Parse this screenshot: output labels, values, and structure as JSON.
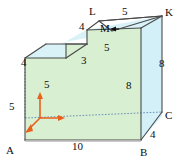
{
  "figure": {
    "colors": {
      "front_face_green": "#d8efd2",
      "side_face_blue": "#d3f0f8",
      "top_face_blue": "#d8f2f8",
      "outline": "#4a4a4a",
      "hidden_edge": "#6b8fb5",
      "axis_arrow": "#e8601c",
      "label_text": "#0d0d0d"
    },
    "vertices": [
      {
        "name": "A",
        "text": "A",
        "x": 6,
        "y": 145
      },
      {
        "name": "B",
        "text": "B",
        "x": 140,
        "y": 147
      },
      {
        "name": "C",
        "text": "C",
        "x": 162,
        "y": 118
      },
      {
        "name": "K",
        "text": "K",
        "x": 165,
        "y": 10
      },
      {
        "name": "L",
        "text": "L",
        "x": 89,
        "y": 9
      },
      {
        "name": "M",
        "text": "M",
        "x": 104,
        "y": 27
      }
    ],
    "dimensions": [
      {
        "name": "base-width",
        "text": "10",
        "x": 75,
        "y": 145
      },
      {
        "name": "front-left-height",
        "text": "5",
        "x": 10,
        "y": 105
      },
      {
        "name": "axis-vertical",
        "text": "5",
        "x": 46,
        "y": 83
      },
      {
        "name": "left-top-depth",
        "text": "4",
        "x": 22,
        "y": 62
      },
      {
        "name": "step-riser",
        "text": "3",
        "x": 84,
        "y": 60
      },
      {
        "name": "upper-top-depth",
        "text": "5",
        "x": 106,
        "y": 47
      },
      {
        "name": "right-front-height",
        "text": "8",
        "x": 128,
        "y": 85
      },
      {
        "name": "right-side-height",
        "text": "8",
        "x": 160,
        "y": 63
      },
      {
        "name": "top-back-width",
        "text": "5",
        "x": 124,
        "y": 10
      },
      {
        "name": "top-left-depth",
        "text": "4",
        "x": 81,
        "y": 25
      },
      {
        "name": "bottom-right-depth",
        "text": "4",
        "x": 152,
        "y": 134
      }
    ],
    "axes": {
      "name": "coordinate-axes",
      "origin": {
        "x": 40,
        "y": 118
      },
      "arrows": [
        {
          "name": "axis-arrow-up",
          "dx": 0,
          "dy": -24
        },
        {
          "name": "axis-arrow-right",
          "dx": 24,
          "dy": 0
        },
        {
          "name": "axis-arrow-down-left",
          "dx": -14,
          "dy": 14
        }
      ]
    }
  }
}
